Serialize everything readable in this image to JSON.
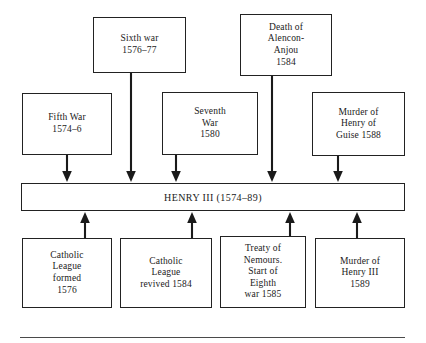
{
  "diagram": {
    "title_bar": {
      "label": "HENRY III (1574–89)"
    },
    "top_row": [
      {
        "id": "sixth-war",
        "label": "Sixth war\n1576–77"
      },
      {
        "id": "death-of-alencon-anjou",
        "label": "Death of\nAlencon-\nAnjou\n1584"
      }
    ],
    "middle_row": [
      {
        "id": "fifth-war",
        "label": "Fifth War\n1574–6"
      },
      {
        "id": "seventh-war",
        "label": "Seventh\nWar\n1580"
      },
      {
        "id": "murder-of-henry-of-guise",
        "label": "Murder of\nHenry of\nGuise 1588"
      }
    ],
    "bottom_row": [
      {
        "id": "catholic-league-formed",
        "label": "Catholic\nLeague\nformed\n1576"
      },
      {
        "id": "catholic-league-revived",
        "label": "Catholic\nLeague\nrevived 1584"
      },
      {
        "id": "treaty-of-nemours",
        "label": "Treaty of\nNemours.\nStart of\nEighth\nwar 1585"
      },
      {
        "id": "murder-of-henry-iii",
        "label": "Murder of\nHenry III\n1589"
      }
    ],
    "colors": {
      "stroke": "#222222",
      "background": "#ffffff",
      "text": "#1a1a1a",
      "rule": "#4a4a4a"
    }
  }
}
